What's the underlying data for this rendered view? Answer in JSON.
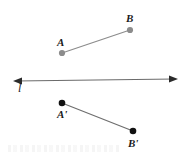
{
  "figure": {
    "width": 189,
    "height": 158,
    "background_color": "#ffffff"
  },
  "colors": {
    "preimage_stroke": "#8c8c8c",
    "preimage_point_fill": "#8c8c8c",
    "image_stroke": "#6e6e6e",
    "image_point_fill": "#111111",
    "line_stroke": "#6b6b6b",
    "label_color": "#1b1b1b"
  },
  "labels": {
    "A": "A",
    "B": "B",
    "A_prime": "A'",
    "B_prime": "B'",
    "line": "l"
  },
  "geometry": {
    "preimage_segment": {
      "name": "segment-AB",
      "endpoints": [
        {
          "name": "A",
          "x": 62,
          "y": 53,
          "radius": 3.1
        },
        {
          "name": "B",
          "x": 130,
          "y": 30,
          "radius": 3.1
        }
      ]
    },
    "mirror_line": {
      "name": "line-l",
      "x1": 14,
      "y1": 81,
      "x2": 177,
      "y2": 79,
      "arrowheads": "both"
    },
    "image_segment": {
      "name": "segment-A-prime-B-prime",
      "endpoints": [
        {
          "name": "A'",
          "x": 62,
          "y": 103,
          "radius": 3.3
        },
        {
          "name": "B'",
          "x": 133,
          "y": 131,
          "radius": 3.3
        }
      ]
    }
  }
}
